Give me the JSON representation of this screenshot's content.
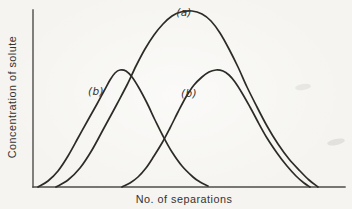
{
  "figure": {
    "ylabel": "Concentration of solute",
    "xlabel": "No. of separations",
    "background": "#f5f4f0",
    "line_color": "#2d2b28",
    "axis_color": "#4e4c49",
    "text_color": "#343230"
  },
  "chart_data": {
    "type": "line",
    "title": "",
    "xlabel": "No. of separations",
    "ylabel": "Concentration of solute",
    "x_ticks": [],
    "y_ticks": [],
    "grid": false,
    "legend": false,
    "series": [
      {
        "label": "(a)",
        "role": "broad-peak",
        "points_px": [
          [
            56,
            187
          ],
          [
            68,
            180
          ],
          [
            80,
            168
          ],
          [
            92,
            150
          ],
          [
            104,
            128
          ],
          [
            117,
            104
          ],
          [
            127,
            85
          ],
          [
            136,
            66
          ],
          [
            145,
            49
          ],
          [
            154,
            35
          ],
          [
            163,
            24
          ],
          [
            172,
            16
          ],
          [
            181,
            12
          ],
          [
            192,
            11
          ],
          [
            202,
            14
          ],
          [
            211,
            21
          ],
          [
            220,
            33
          ],
          [
            229,
            49
          ],
          [
            238,
            67
          ],
          [
            247,
            87
          ],
          [
            257,
            107
          ],
          [
            267,
            126
          ],
          [
            278,
            144
          ],
          [
            289,
            159
          ],
          [
            300,
            171
          ],
          [
            309,
            180
          ],
          [
            318,
            187
          ]
        ]
      },
      {
        "label": "(b)",
        "role": "left-peak",
        "points_px": [
          [
            38,
            187
          ],
          [
            48,
            181
          ],
          [
            58,
            171
          ],
          [
            68,
            156
          ],
          [
            78,
            138
          ],
          [
            88,
            120
          ],
          [
            97,
            104
          ],
          [
            104,
            91
          ],
          [
            110,
            80
          ],
          [
            115,
            73
          ],
          [
            120,
            70
          ],
          [
            126,
            71
          ],
          [
            132,
            77
          ],
          [
            139,
            88
          ],
          [
            147,
            103
          ],
          [
            155,
            120
          ],
          [
            163,
            136
          ],
          [
            172,
            152
          ],
          [
            182,
            166
          ],
          [
            193,
            177
          ],
          [
            200,
            182
          ],
          [
            208,
            186
          ]
        ]
      },
      {
        "label": "(b)",
        "role": "right-peak",
        "points_px": [
          [
            122,
            187
          ],
          [
            130,
            183
          ],
          [
            138,
            177
          ],
          [
            146,
            168
          ],
          [
            154,
            156
          ],
          [
            162,
            143
          ],
          [
            170,
            128
          ],
          [
            178,
            112
          ],
          [
            186,
            97
          ],
          [
            194,
            85
          ],
          [
            202,
            77
          ],
          [
            209,
            72
          ],
          [
            216,
            70
          ],
          [
            223,
            71
          ],
          [
            229,
            75
          ],
          [
            235,
            82
          ],
          [
            242,
            93
          ],
          [
            250,
            107
          ],
          [
            258,
            122
          ],
          [
            267,
            138
          ],
          [
            277,
            153
          ],
          [
            287,
            166
          ],
          [
            296,
            176
          ],
          [
            304,
            183
          ],
          [
            310,
            187
          ]
        ]
      }
    ],
    "annotations": [
      {
        "text": "(a)",
        "x_px": 184,
        "y_px": 12
      },
      {
        "text": "(b)",
        "x_px": 96,
        "y_px": 91
      },
      {
        "text": "(b)",
        "x_px": 189,
        "y_px": 93
      }
    ]
  }
}
